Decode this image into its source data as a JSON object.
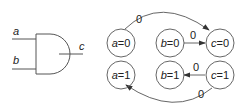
{
  "gate": {
    "type": "AND",
    "inputs": [
      "a",
      "b"
    ],
    "output": "c"
  },
  "nodes": [
    {
      "id": "a0",
      "var": "a",
      "val": "0",
      "eq": "="
    },
    {
      "id": "b0",
      "var": "b",
      "val": "0",
      "eq": "="
    },
    {
      "id": "c0",
      "var": "c",
      "val": "0",
      "eq": "="
    },
    {
      "id": "a1",
      "var": "a",
      "val": "1",
      "eq": "="
    },
    {
      "id": "b1",
      "var": "b",
      "val": "1",
      "eq": "="
    },
    {
      "id": "c1",
      "var": "c",
      "val": "1",
      "eq": "="
    }
  ],
  "edges": [
    {
      "from": "a0",
      "to": "c0",
      "label": "0"
    },
    {
      "from": "b0",
      "to": "c0",
      "label": "0"
    },
    {
      "from": "c1",
      "to": "b1",
      "label": "0"
    },
    {
      "from": "c1",
      "to": "a1",
      "label": "0"
    }
  ],
  "colors": {
    "stroke": "#555555",
    "text": "#222222",
    "background": "#ffffff"
  }
}
